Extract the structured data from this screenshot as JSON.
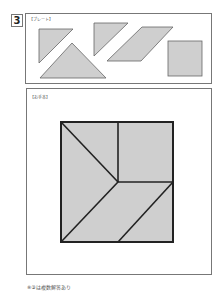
{
  "question": {
    "number": "3"
  },
  "plate": {
    "label": "【プレート】",
    "pieces": [
      {
        "type": "triangle",
        "name": "small-triangle-1"
      },
      {
        "type": "triangle",
        "name": "large-triangle"
      },
      {
        "type": "triangle",
        "name": "small-triangle-2"
      },
      {
        "type": "parallelogram",
        "name": "parallelogram"
      },
      {
        "type": "square",
        "name": "square"
      }
    ]
  },
  "example": {
    "label": "【お手本】",
    "shape": "square composed of tangram pieces"
  },
  "footnote": "※③は複数解答あり",
  "colors": {
    "piece_fill": "#cfcfcf",
    "piece_stroke": "#666666",
    "example_stroke": "#222222"
  }
}
